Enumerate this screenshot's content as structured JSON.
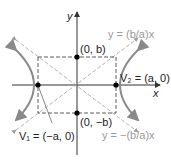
{
  "diagram": {
    "axes": {
      "x_label": "x",
      "y_label": "y"
    },
    "points": {
      "top": "(0, b)",
      "bottom": "(0, −b)",
      "v1": "V₁ = (−a, 0)",
      "v2": "V₂ = (a, 0)"
    },
    "asymptotes": {
      "positive": "y = (b/a)x",
      "negative": "y = −(b/a)x"
    },
    "colors": {
      "curve": "#8a8a8a",
      "axis": "#333333",
      "asymptote": "#a0a0a0",
      "box": "#333333",
      "point": "#000000"
    }
  }
}
